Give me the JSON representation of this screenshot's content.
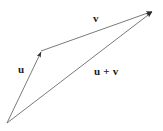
{
  "diagram": {
    "background_color": "#ffffff",
    "line_color": "#666666",
    "arrow_color": "#333333",
    "label_color": "#1a1a1a",
    "canvas": {
      "width": 163,
      "height": 131
    },
    "points": {
      "origin": {
        "name": "origin",
        "x": 7,
        "y": 123
      },
      "vertex": {
        "name": "head-of-u",
        "x": 41,
        "y": 51
      },
      "tip": {
        "name": "head-of-v-and-sum",
        "x": 153,
        "y": 11
      }
    },
    "vectors": [
      {
        "id": "u",
        "label": "u",
        "from": "origin",
        "to": "vertex",
        "x1": 7,
        "y1": 123,
        "x2": 41,
        "y2": 51,
        "label_x": 23,
        "label_y": 70
      },
      {
        "id": "v",
        "label": "v",
        "from": "vertex",
        "to": "tip",
        "x1": 41,
        "y1": 51,
        "x2": 153,
        "y2": 11,
        "label_x": 97,
        "label_y": 19
      },
      {
        "id": "u_plus_v",
        "label": "u + v",
        "from": "origin",
        "to": "tip",
        "x1": 7,
        "y1": 123,
        "x2": 153,
        "y2": 11,
        "label_x": 109,
        "label_y": 72
      }
    ],
    "labels": {
      "u": "u",
      "v": "v",
      "u_plus_v": "u + v"
    }
  }
}
